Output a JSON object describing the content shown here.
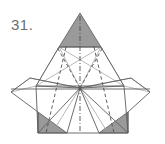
{
  "figure": {
    "label": "31.",
    "label_color": "#6d6d6d",
    "background_color": "#ffffff",
    "caption_position": "top-left",
    "style": {
      "solid_line_color": "#595959",
      "light_line_color": "#8c8c8c",
      "hidden_line_color": "#4d4d4d",
      "shaded_face_fill": "#9a9a9a",
      "shaded_face_stroke": "#5a5a5a",
      "stroke_width": 0.8
    },
    "geometry": {
      "apex_top": [
        80,
        13
      ],
      "center_point": [
        80,
        88
      ],
      "left_vertex": [
        11,
        92
      ],
      "right_vertex": [
        150,
        92
      ],
      "base_left": [
        38,
        133
      ],
      "base_right": [
        128,
        133
      ],
      "top_shaded_triangle": [
        [
          80,
          13
        ],
        [
          59,
          47
        ],
        [
          101,
          47
        ]
      ],
      "bottom_left_shaded_triangle": [
        [
          38,
          133
        ],
        [
          66,
          133
        ],
        [
          38,
          113
        ]
      ],
      "bottom_right_shaded_triangle": [
        [
          100,
          133
        ],
        [
          128,
          133
        ],
        [
          128,
          113
        ]
      ],
      "upper_trapezoid": [
        [
          59,
          47
        ],
        [
          101,
          47
        ],
        [
          124,
          86
        ],
        [
          36,
          86
        ]
      ],
      "mid_band_left": [
        30,
        87
      ],
      "mid_band_right": [
        131,
        87
      ]
    },
    "elements": [
      {
        "name": "top-shaded-triangle",
        "type": "shaded-face"
      },
      {
        "name": "bottom-left-shaded-triangle",
        "type": "shaded-face"
      },
      {
        "name": "bottom-right-shaded-triangle",
        "type": "shaded-face"
      },
      {
        "name": "upper-trapezoid-outline",
        "type": "solid-edge-group"
      },
      {
        "name": "left-wing-outline",
        "type": "solid-edge-group"
      },
      {
        "name": "right-wing-outline",
        "type": "solid-edge-group"
      },
      {
        "name": "lower-body-outline",
        "type": "solid-edge-group"
      },
      {
        "name": "base-line",
        "type": "solid-edge"
      },
      {
        "name": "horizontal-mid-line",
        "type": "solid-edge"
      },
      {
        "name": "radial-fold-lines",
        "type": "solid-edge-group"
      },
      {
        "name": "vertical-center-axis",
        "type": "dash-dot-line"
      },
      {
        "name": "hidden-fold-lines",
        "type": "dashed-line-group"
      }
    ]
  }
}
